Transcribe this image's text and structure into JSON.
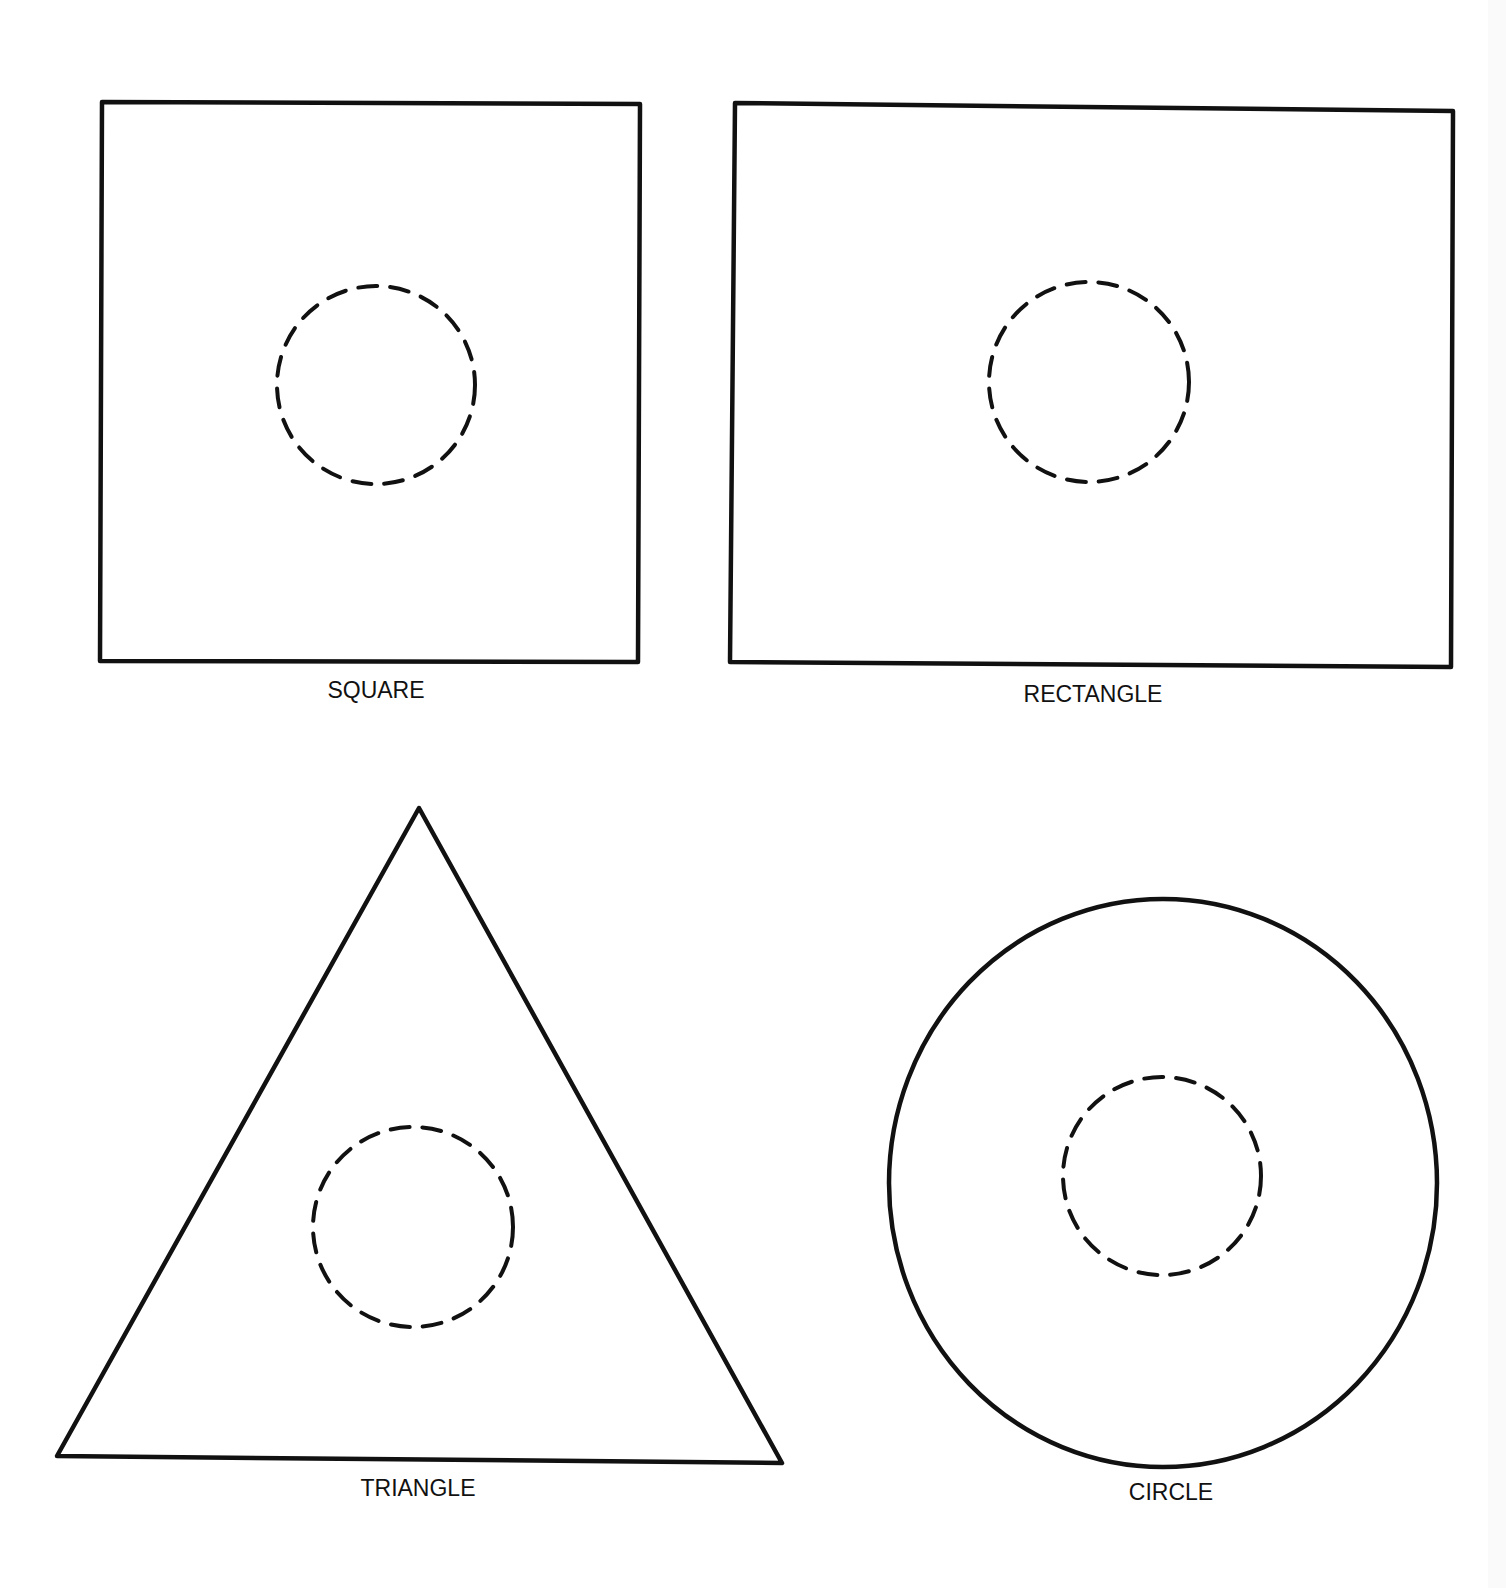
{
  "figure": {
    "background": "#ffffff",
    "stroke_color": "#111111",
    "shapes": [
      {
        "id": "square",
        "label": "SQUARE"
      },
      {
        "id": "rectangle",
        "label": "RECTANGLE"
      },
      {
        "id": "triangle",
        "label": "TRIANGLE"
      },
      {
        "id": "circle",
        "label": "CIRCLE"
      }
    ],
    "inner_marker": "dashed-circle"
  }
}
